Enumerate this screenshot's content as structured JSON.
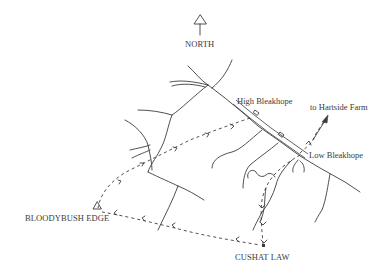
{
  "map": {
    "north_label": "NORTH",
    "places": {
      "high_bleakhope": "High Bleakhope",
      "low_bleakhope": "Low Bleakhope",
      "hartside": "to Hartside Farm",
      "bloodybush": "BLOODYBUSH EDGE",
      "cushat": "CUSHAT LAW"
    },
    "icons": {
      "north_arrow": "north-arrow-icon",
      "trig_point": "triangle-summit-icon",
      "summit_point": "dot-summit-icon"
    },
    "colors": {
      "ink": "#3c3c3c",
      "background": "#ffffff"
    }
  }
}
